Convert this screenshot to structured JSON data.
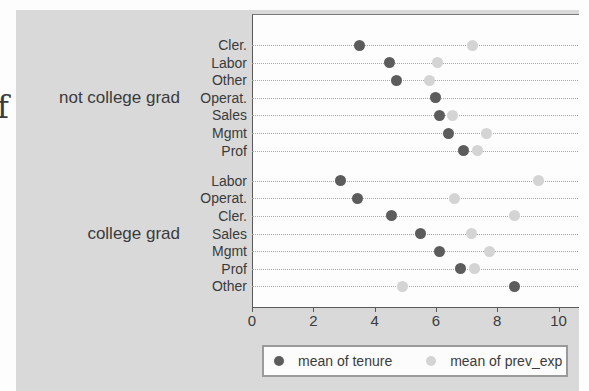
{
  "page": {
    "stray_text": "f"
  },
  "colors": {
    "figure_background": "#d9d9d9",
    "plot_background": "#fdfdfd",
    "tenure_dot": "#5c5c5c",
    "prev_exp_dot": "#d4d4d4",
    "gridline": "#a6a6a6",
    "axis_line": "#5a5a5a",
    "text": "#3b3b3b"
  },
  "chart_data": {
    "type": "scatter",
    "subtype": "dot-plot",
    "title": "",
    "xlabel": "",
    "ylabel": "",
    "x_ticks": [
      0,
      2,
      4,
      6,
      8,
      10
    ],
    "xlim": [
      0,
      10.6
    ],
    "grid": "dotted-horizontal",
    "legend_position": "bottom",
    "legend": [
      {
        "label": "mean of tenure",
        "color": "#5c5c5c"
      },
      {
        "label": "mean of prev_exp",
        "color": "#d4d4d4"
      }
    ],
    "groups": [
      {
        "label": "not college grad",
        "rows": [
          {
            "category": "Cler.",
            "tenure": 3.5,
            "prev_exp": 7.2
          },
          {
            "category": "Labor",
            "tenure": 4.5,
            "prev_exp": 6.05
          },
          {
            "category": "Other",
            "tenure": 4.7,
            "prev_exp": 5.8
          },
          {
            "category": "Operat.",
            "tenure": 6.0,
            "prev_exp": 6.0
          },
          {
            "category": "Sales",
            "tenure": 6.1,
            "prev_exp": 6.55
          },
          {
            "category": "Mgmt",
            "tenure": 6.4,
            "prev_exp": 7.65
          },
          {
            "category": "Prof",
            "tenure": 6.9,
            "prev_exp": 7.35
          }
        ]
      },
      {
        "label": "college grad",
        "rows": [
          {
            "category": "Labor",
            "tenure": 2.9,
            "prev_exp": 9.35
          },
          {
            "category": "Operat.",
            "tenure": 3.45,
            "prev_exp": 6.6
          },
          {
            "category": "Cler.",
            "tenure": 4.55,
            "prev_exp": 8.55
          },
          {
            "category": "Sales",
            "tenure": 5.5,
            "prev_exp": 7.15
          },
          {
            "category": "Mgmt",
            "tenure": 6.1,
            "prev_exp": 7.75
          },
          {
            "category": "Prof",
            "tenure": 6.8,
            "prev_exp": 7.25
          },
          {
            "category": "Other",
            "tenure": 8.55,
            "prev_exp": 4.9
          }
        ]
      }
    ]
  }
}
